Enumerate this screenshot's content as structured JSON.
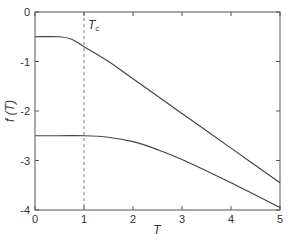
{
  "chart_data": {
    "type": "line",
    "title": "",
    "xlabel": "T",
    "ylabel": "f (T)",
    "xlim": [
      0,
      5
    ],
    "ylim": [
      -4,
      0
    ],
    "xticks": [
      "0",
      "1",
      "2",
      "3",
      "4",
      "5"
    ],
    "yticks": [
      "0",
      "-1",
      "-2",
      "-3",
      "-4"
    ],
    "grid": false,
    "annotations": [
      {
        "text": "Tc",
        "x": 1,
        "y": -0.25,
        "type": "vertical-dashed-line"
      }
    ],
    "series": [
      {
        "name": "upper",
        "x": [
          0,
          0.5,
          0.75,
          1,
          1.5,
          2,
          3,
          4,
          5
        ],
        "values": [
          -0.5,
          -0.5,
          -0.55,
          -0.7,
          -1.0,
          -1.35,
          -2.05,
          -2.75,
          -3.45
        ]
      },
      {
        "name": "lower",
        "x": [
          0,
          0.5,
          1,
          1.5,
          2,
          2.5,
          3,
          4,
          5
        ],
        "values": [
          -2.5,
          -2.5,
          -2.5,
          -2.53,
          -2.62,
          -2.78,
          -2.98,
          -3.45,
          -3.95
        ]
      }
    ]
  }
}
